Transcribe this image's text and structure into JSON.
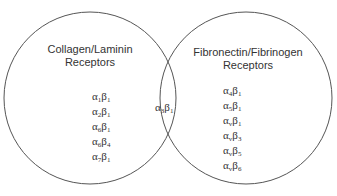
{
  "diagram": {
    "type": "venn",
    "left_set": {
      "title_line1": "Collagen/Laminin",
      "title_line2": "Receptors",
      "members": [
        {
          "a": "1",
          "b": "1"
        },
        {
          "a": "2",
          "b": "1"
        },
        {
          "a": "6",
          "b": "1"
        },
        {
          "a": "6",
          "b": "4"
        },
        {
          "a": "7",
          "b": "1"
        }
      ]
    },
    "right_set": {
      "title_line1": "Fibronectin/Fibrinogen",
      "title_line2": "Receptors",
      "members": [
        {
          "a": "4",
          "b": "1"
        },
        {
          "a": "5",
          "b": "1"
        },
        {
          "a": "v",
          "b": "1"
        },
        {
          "a": "v",
          "b": "3"
        },
        {
          "a": "v",
          "b": "5"
        },
        {
          "a": "v",
          "b": "6"
        }
      ]
    },
    "intersection": {
      "members": [
        {
          "a": "3",
          "b": "1"
        }
      ]
    },
    "symbols": {
      "alpha": "α",
      "beta": "β"
    },
    "stroke_color": "#555555"
  }
}
